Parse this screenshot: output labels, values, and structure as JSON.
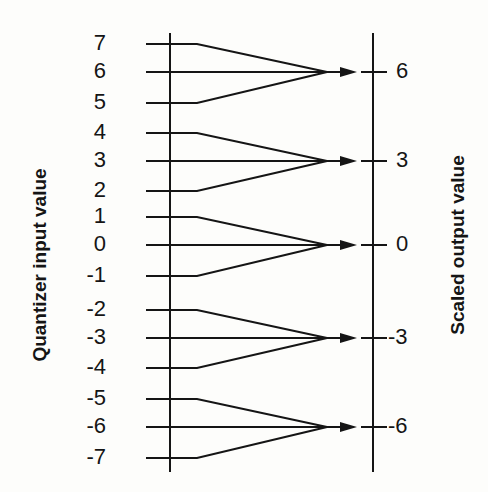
{
  "left_axis": {
    "title": "Quantizer input value"
  },
  "right_axis": {
    "title": "Scaled output value"
  },
  "inputs": [
    {
      "label": "7",
      "y": 44,
      "group": 0
    },
    {
      "label": "6",
      "y": 72,
      "group": 0
    },
    {
      "label": "5",
      "y": 103,
      "group": 0
    },
    {
      "label": "4",
      "y": 133,
      "group": 1
    },
    {
      "label": "3",
      "y": 161,
      "group": 1
    },
    {
      "label": "2",
      "y": 191,
      "group": 1
    },
    {
      "label": "1",
      "y": 217,
      "group": 2
    },
    {
      "label": "0",
      "y": 245,
      "group": 2
    },
    {
      "label": "-1",
      "y": 276,
      "group": 2
    },
    {
      "label": "-2",
      "y": 310,
      "group": 3
    },
    {
      "label": "-3",
      "y": 338,
      "group": 3
    },
    {
      "label": "-4",
      "y": 368,
      "group": 3
    },
    {
      "label": "-5",
      "y": 399,
      "group": 4
    },
    {
      "label": "-6",
      "y": 427,
      "group": 4
    },
    {
      "label": "-7",
      "y": 458,
      "group": 4
    }
  ],
  "outputs": [
    {
      "label": "6",
      "y": 72
    },
    {
      "label": "3",
      "y": 161
    },
    {
      "label": "0",
      "y": 245
    },
    {
      "label": "-3",
      "y": 338
    },
    {
      "label": "-6",
      "y": 427
    }
  ],
  "colors": {
    "ink": "#151515",
    "background": "#fdfdfb"
  }
}
